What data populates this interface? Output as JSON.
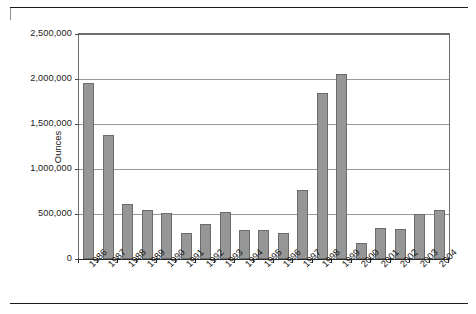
{
  "figure": {
    "has_top_rule": true,
    "has_bottom_rule": true,
    "background_color": "#ffffff"
  },
  "chart_data": {
    "type": "bar",
    "title": "",
    "subtitle": "",
    "xlabel": "",
    "ylabel": "Ounces",
    "ylim": [
      0,
      2500000
    ],
    "grid": true,
    "legend": null,
    "bar_color": "#969696",
    "bar_edge_color": "#6b6b6b",
    "ytick_labels": [
      "0",
      "500,000",
      "1,000,000",
      "1,500,000",
      "2,000,000",
      "2,500,000"
    ],
    "ytick_values": [
      0,
      500000,
      1000000,
      1500000,
      2000000,
      2500000
    ],
    "categories": [
      "1986",
      "1987",
      "1988",
      "1989",
      "1990",
      "1991",
      "1992",
      "1993",
      "1994",
      "1995",
      "1996",
      "1997",
      "1998",
      "1999",
      "2000",
      "2001",
      "2002",
      "2003",
      "2004"
    ],
    "values": [
      1960000,
      1380000,
      610000,
      550000,
      515000,
      285000,
      390000,
      520000,
      325000,
      320000,
      290000,
      770000,
      1840000,
      2055000,
      175000,
      345000,
      330000,
      495000,
      545000
    ]
  }
}
